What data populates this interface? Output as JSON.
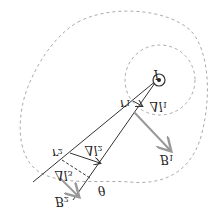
{
  "diagram": {
    "current_label": "I",
    "labels": {
      "r1": "r",
      "r1_sub": "1",
      "dl1": "Δl",
      "dl1_sub": "1",
      "B1": "B",
      "B1_sub": "1",
      "r2": "r",
      "r2_sub": "2",
      "dl2": "Δl",
      "dl2_sub": "2",
      "dl3": "Δl",
      "dl3_sub": "3",
      "B2": "B",
      "B2_sub": "2",
      "theta": "θ"
    },
    "colors": {
      "line": "#333333",
      "arrow_B": "#999999",
      "dashed": "#aaaaaa"
    }
  }
}
